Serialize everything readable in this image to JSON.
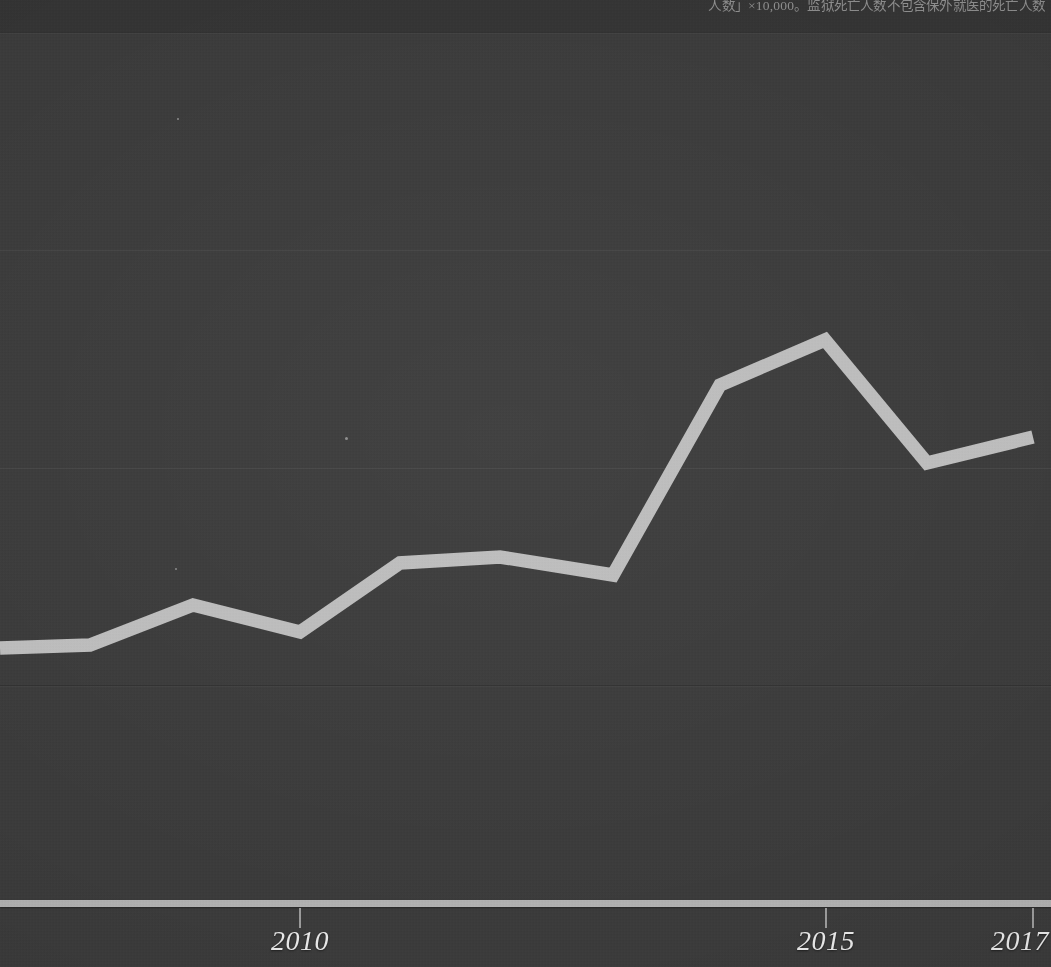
{
  "footnote": {
    "text": "人数」×10,000。监狱死亡人数不包含保外就医的死亡人数"
  },
  "axis": {
    "x_tick_labels": [
      "2010",
      "2015",
      "2017"
    ],
    "x_tick_pixels": [
      300,
      826,
      1033
    ],
    "baseline_label": ""
  },
  "chart_data": {
    "type": "line",
    "title": "",
    "subtitle": "",
    "xlabel": "",
    "ylabel": "",
    "grid": true,
    "legend_position": "none",
    "line_color": "#bcbcbc",
    "background_color": "#3b3b3b",
    "axis_color": "#b0b0b0",
    "label_color": "#e8e8e8",
    "x_tick_labels_visible": [
      "2010",
      "2015",
      "2017"
    ],
    "x": [
      2007,
      2008,
      2009,
      2010,
      2011,
      2012,
      2013,
      2014,
      2015,
      2016,
      2017
    ],
    "values": [
      1.17,
      1.18,
      1.33,
      1.2,
      1.52,
      1.55,
      1.47,
      2.33,
      2.53,
      1.96,
      2.09
    ],
    "pixel_points": [
      {
        "x": 0,
        "y": 648
      },
      {
        "x": 90,
        "y": 645
      },
      {
        "x": 193,
        "y": 605
      },
      {
        "x": 300,
        "y": 632
      },
      {
        "x": 400,
        "y": 563
      },
      {
        "x": 500,
        "y": 557
      },
      {
        "x": 613,
        "y": 575
      },
      {
        "x": 720,
        "y": 385
      },
      {
        "x": 825,
        "y": 340
      },
      {
        "x": 927,
        "y": 463
      },
      {
        "x": 1033,
        "y": 437
      }
    ],
    "gridline_pixels": [
      32,
      250,
      468,
      685
    ],
    "baseline_pixel": 903,
    "ylim_note": "y axis labels cropped out of frame"
  },
  "gridlines": [
    {
      "y": 32,
      "style": "dark"
    },
    {
      "y": 250,
      "style": "light"
    },
    {
      "y": 468,
      "style": "light"
    },
    {
      "y": 685,
      "style": "dark"
    }
  ],
  "specks": [
    {
      "x": 345,
      "y": 437,
      "d": 3
    },
    {
      "x": 175,
      "y": 568,
      "d": 2
    },
    {
      "x": 177,
      "y": 118,
      "d": 2
    }
  ]
}
